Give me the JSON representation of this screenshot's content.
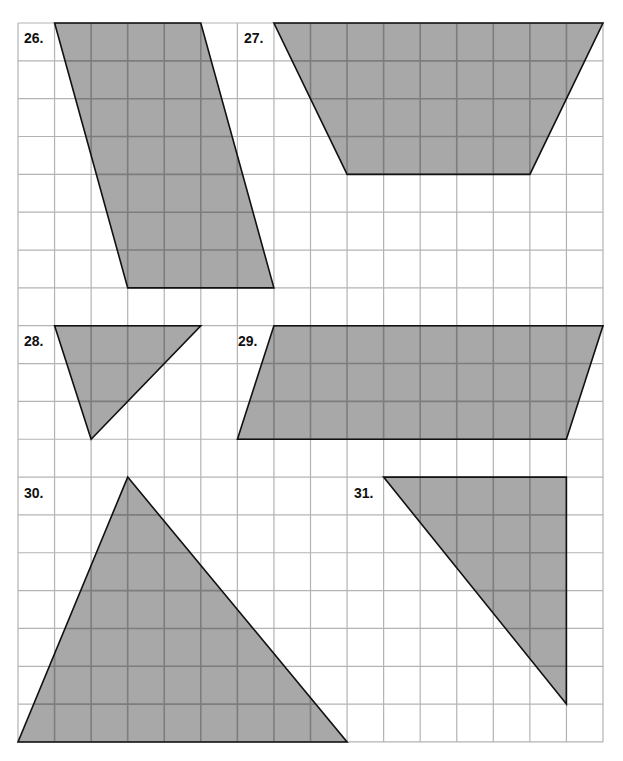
{
  "grid": {
    "origin_x": 18,
    "origin_y": 23,
    "cols": 16,
    "rows": 19,
    "cell_w": 36.5625,
    "cell_h": 37.84,
    "line_color": "#b3b3b3",
    "line_color_in_shape": "#7d7d7d"
  },
  "style": {
    "fill": "#a8a8a8",
    "stroke": "#111111"
  },
  "figures": [
    {
      "label": "26.",
      "shape": "parallelogram",
      "label_pos": [
        24,
        43
      ],
      "vertices": [
        [
          1,
          0
        ],
        [
          5,
          0
        ],
        [
          7,
          7
        ],
        [
          3,
          7
        ]
      ]
    },
    {
      "label": "27.",
      "shape": "trapezoid",
      "label_pos": [
        244,
        43
      ],
      "vertices": [
        [
          7,
          0
        ],
        [
          16,
          0
        ],
        [
          14,
          4
        ],
        [
          9,
          4
        ]
      ]
    },
    {
      "label": "28.",
      "shape": "triangle",
      "label_pos": [
        24,
        346
      ],
      "vertices": [
        [
          1,
          8
        ],
        [
          5,
          8
        ],
        [
          2,
          11
        ]
      ]
    },
    {
      "label": "29.",
      "shape": "parallelogram",
      "label_pos": [
        238,
        346
      ],
      "vertices": [
        [
          7,
          8
        ],
        [
          16,
          8
        ],
        [
          15,
          11
        ],
        [
          6,
          11
        ]
      ]
    },
    {
      "label": "30.",
      "shape": "triangle",
      "label_pos": [
        24,
        498
      ],
      "vertices": [
        [
          3,
          12
        ],
        [
          9,
          19
        ],
        [
          0,
          19
        ]
      ]
    },
    {
      "label": "31.",
      "shape": "triangle",
      "label_pos": [
        354,
        498
      ],
      "vertices": [
        [
          10,
          12
        ],
        [
          15,
          12
        ],
        [
          15,
          18
        ]
      ]
    }
  ]
}
